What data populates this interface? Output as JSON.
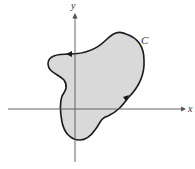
{
  "diagram": {
    "axes": {
      "x_label": "x",
      "y_label": "y"
    },
    "curve": {
      "label": "C",
      "fill": "#d9d9d9",
      "stroke": "#1a1a1a",
      "orientation": "counterclockwise"
    },
    "colors": {
      "axis": "#555555",
      "background": "#ffffff"
    }
  }
}
